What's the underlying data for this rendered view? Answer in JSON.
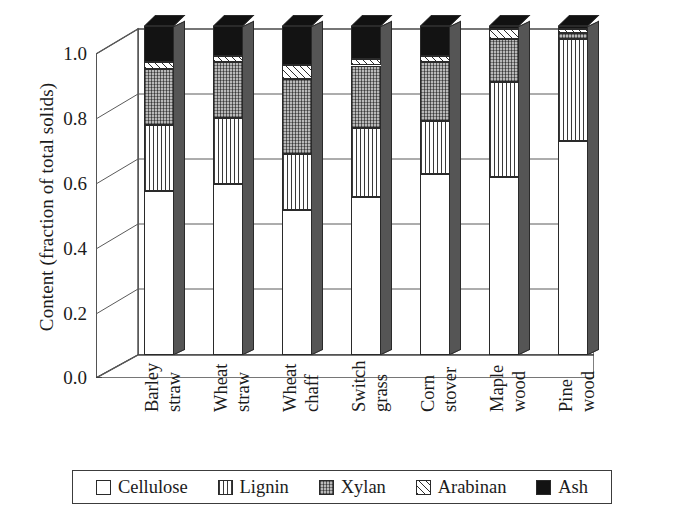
{
  "chart_data": {
    "type": "bar",
    "subtype": "stacked-bar-3d",
    "title": "",
    "xlabel": "",
    "ylabel": "Content (fraction of total solids)",
    "ylim": [
      0.0,
      1.0
    ],
    "ytick_labels": [
      "1.0",
      "0.8",
      "0.6",
      "0.4",
      "0.2",
      "0.0"
    ],
    "ytick_values": [
      1.0,
      0.8,
      0.6,
      0.4,
      0.2,
      0.0
    ],
    "grid": true,
    "grid_axis": "y",
    "legend_position": "bottom",
    "stacked": true,
    "categories": [
      "Barley straw",
      "Wheat straw",
      "Wheat chaff",
      "Switch grass",
      "Corn stover",
      "Maple wood",
      "Pine wood"
    ],
    "category_lines": [
      [
        "Barley",
        "straw"
      ],
      [
        "Wheat",
        "straw"
      ],
      [
        "Wheat",
        "chaff"
      ],
      [
        "Switch",
        "grass"
      ],
      [
        "Corn",
        "stover"
      ],
      [
        "Maple",
        "wood"
      ],
      [
        "Pine",
        "wood"
      ]
    ],
    "series": [
      {
        "name": "Cellulose",
        "pattern": "open-white",
        "color": "#ffffff",
        "values": [
          0.5,
          0.52,
          0.44,
          0.48,
          0.55,
          0.54,
          0.65
        ]
      },
      {
        "name": "Lignin",
        "pattern": "vertical-lines",
        "color": "#3a3a3a",
        "values": [
          0.2,
          0.2,
          0.17,
          0.21,
          0.16,
          0.29,
          0.31
        ]
      },
      {
        "name": "Xylan",
        "pattern": "fine-grid",
        "color": "#b4b4b4",
        "values": [
          0.17,
          0.17,
          0.23,
          0.19,
          0.18,
          0.13,
          0.02
        ]
      },
      {
        "name": "Arabinan",
        "pattern": "checkered",
        "color": "#e8e8e8",
        "values": [
          0.02,
          0.02,
          0.04,
          0.02,
          0.02,
          0.03,
          0.01
        ]
      },
      {
        "name": "Ash",
        "pattern": "solid-black",
        "color": "#131313",
        "values": [
          0.11,
          0.09,
          0.12,
          0.1,
          0.09,
          0.01,
          0.01
        ]
      }
    ],
    "cumulative_tops": {
      "Barley straw": {
        "cellulose": 0.5,
        "lignin": 0.7,
        "xylan": 0.87,
        "arabinan": 0.89,
        "ash": 1.0
      },
      "Wheat straw": {
        "cellulose": 0.52,
        "lignin": 0.72,
        "xylan": 0.89,
        "arabinan": 0.91,
        "ash": 1.0
      },
      "Wheat chaff": {
        "cellulose": 0.44,
        "lignin": 0.61,
        "xylan": 0.84,
        "arabinan": 0.88,
        "ash": 1.0
      },
      "Switch grass": {
        "cellulose": 0.48,
        "lignin": 0.69,
        "xylan": 0.88,
        "arabinan": 0.9,
        "ash": 1.0
      },
      "Corn stover": {
        "cellulose": 0.55,
        "lignin": 0.71,
        "xylan": 0.89,
        "arabinan": 0.91,
        "ash": 1.0
      },
      "Maple wood": {
        "cellulose": 0.54,
        "lignin": 0.83,
        "xylan": 0.96,
        "arabinan": 0.99,
        "ash": 1.0
      },
      "Pine wood": {
        "cellulose": 0.65,
        "lignin": 0.96,
        "xylan": 0.98,
        "arabinan": 0.99,
        "ash": 1.0
      }
    }
  },
  "legend": {
    "items": [
      {
        "label": "Cellulose",
        "pattern": "open-white"
      },
      {
        "label": "Lignin",
        "pattern": "vertical-lines"
      },
      {
        "label": "Xylan",
        "pattern": "fine-grid"
      },
      {
        "label": "Arabinan",
        "pattern": "checkered"
      },
      {
        "label": "Ash",
        "pattern": "solid-black"
      }
    ]
  },
  "axes": {
    "y_title": "Content (fraction of total solids)"
  }
}
